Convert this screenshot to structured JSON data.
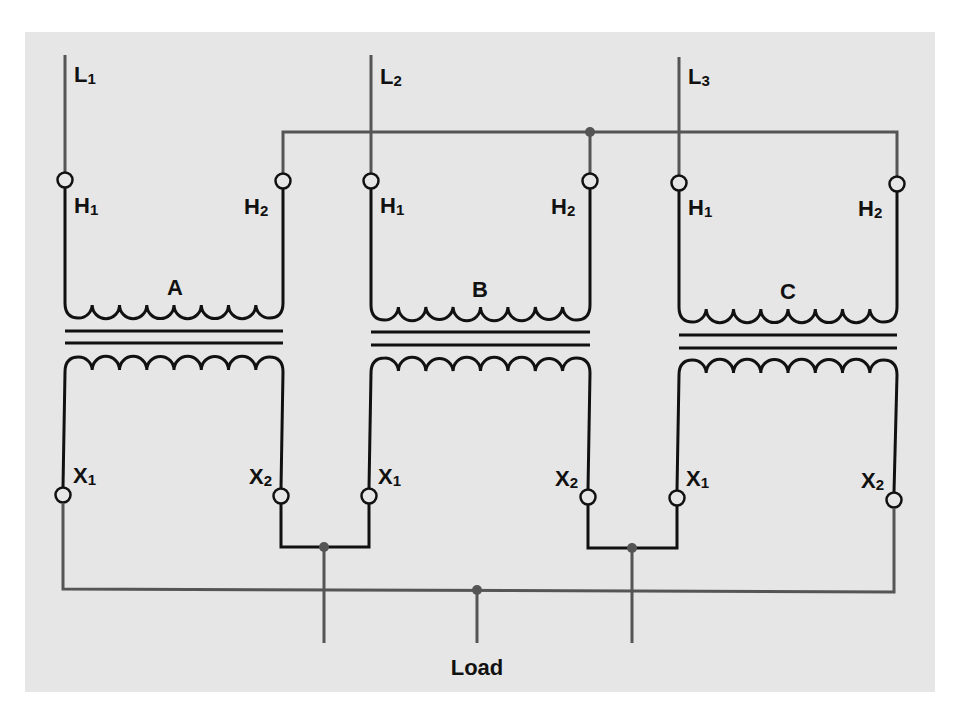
{
  "diagram": {
    "type": "three-phase transformer bank wiring",
    "colors": {
      "background_panel": "#e6e6e6",
      "coil": "#111111",
      "wire": "#555555",
      "junction_dot": "#555555"
    },
    "lines": [
      {
        "id": "L1",
        "letter": "L",
        "sub": "1"
      },
      {
        "id": "L2",
        "letter": "L",
        "sub": "2"
      },
      {
        "id": "L3",
        "letter": "L",
        "sub": "3"
      }
    ],
    "transformers": [
      {
        "name": "A",
        "primary": {
          "h1": {
            "letter": "H",
            "sub": "1"
          },
          "h2": {
            "letter": "H",
            "sub": "2"
          },
          "loops": 8
        },
        "secondary": {
          "x1": {
            "letter": "X",
            "sub": "1"
          },
          "x2": {
            "letter": "X",
            "sub": "2"
          },
          "loops": 8
        }
      },
      {
        "name": "B",
        "primary": {
          "h1": {
            "letter": "H",
            "sub": "1"
          },
          "h2": {
            "letter": "H",
            "sub": "2"
          },
          "loops": 8
        },
        "secondary": {
          "x1": {
            "letter": "X",
            "sub": "1"
          },
          "x2": {
            "letter": "X",
            "sub": "2"
          },
          "loops": 8
        }
      },
      {
        "name": "C",
        "primary": {
          "h1": {
            "letter": "H",
            "sub": "1"
          },
          "h2": {
            "letter": "H",
            "sub": "2"
          },
          "loops": 8
        },
        "secondary": {
          "x1": {
            "letter": "X",
            "sub": "1"
          },
          "x2": {
            "letter": "X",
            "sub": "2"
          },
          "loops": 8
        }
      }
    ],
    "load_label": "Load"
  }
}
